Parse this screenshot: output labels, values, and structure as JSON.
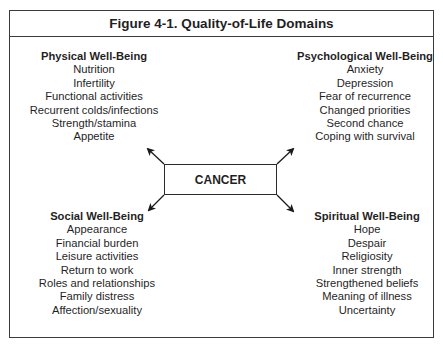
{
  "figure": {
    "title": "Figure 4-1. Quality-of-Life Domains",
    "center_label": "CANCER",
    "domains": {
      "physical": {
        "heading": "Physical Well-Being",
        "items": [
          "Nutrition",
          "Infertility",
          "Functional activities",
          "Recurrent colds/infections",
          "Strength/stamina",
          "Appetite"
        ]
      },
      "psychological": {
        "heading": "Psychological Well-Being",
        "items": [
          "Anxiety",
          "Depression",
          "Fear of recurrence",
          "Changed priorities",
          "Second chance",
          "Coping with survival"
        ]
      },
      "social": {
        "heading": "Social Well-Being",
        "items": [
          "Appearance",
          "Financial burden",
          "Leisure activities",
          "Return to work",
          "Roles and relationships",
          "Family distress",
          "Affection/sexuality"
        ]
      },
      "spiritual": {
        "heading": "Spiritual Well-Being",
        "items": [
          "Hope",
          "Despair",
          "Religiosity",
          "Inner strength",
          "Strengthened beliefs",
          "Meaning of illness",
          "Uncertainty"
        ]
      }
    },
    "colors": {
      "line": "#2a2a2a",
      "text": "#1f1f1f",
      "background": "#ffffff"
    }
  }
}
